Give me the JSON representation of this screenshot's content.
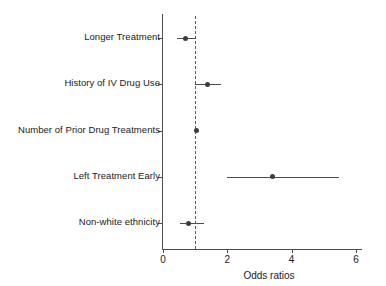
{
  "chart_data": {
    "type": "scatter",
    "subtype": "forest-plot",
    "title": "",
    "xlabel": "Odds ratios",
    "ylabel": "",
    "xlim": [
      0,
      6.3
    ],
    "xticks": [
      0,
      2,
      4,
      6
    ],
    "xtick_labels": [
      "0",
      "2",
      "4",
      "6"
    ],
    "grid": false,
    "legend": "none",
    "reference_line": {
      "value": 1,
      "style": "dashed",
      "color": "#5b5b6b"
    },
    "point_color": "#3c3c46",
    "line_color": "#4d4d4d",
    "categories": [
      "Longer Treatment",
      "History of IV Drug Use",
      "Number of Prior Drug Treatments",
      "Left Treatment Early",
      "Non-white ethnicity"
    ],
    "values": [
      0.71,
      1.37,
      1.05,
      3.39,
      0.78
    ],
    "ci_low": [
      0.44,
      1.0,
      1.0,
      1.99,
      0.53
    ],
    "ci_high": [
      1.03,
      1.8,
      1.1,
      5.47,
      1.27
    ],
    "points": [
      {
        "label": "Longer Treatment",
        "or": 0.71,
        "ci_low": 0.44,
        "ci_high": 1.03
      },
      {
        "label": "History of IV Drug Use",
        "or": 1.37,
        "ci_low": 1.0,
        "ci_high": 1.8
      },
      {
        "label": "Number of Prior Drug Treatments",
        "or": 1.05,
        "ci_low": 1.0,
        "ci_high": 1.1
      },
      {
        "label": "Left Treatment Early",
        "or": 3.39,
        "ci_low": 1.99,
        "ci_high": 5.47
      },
      {
        "label": "Non-white ethnicity",
        "or": 0.78,
        "ci_low": 0.53,
        "ci_high": 1.27
      }
    ]
  },
  "axis": {
    "x_title": "Odds ratios",
    "tick_0": "0",
    "tick_2": "2",
    "tick_4": "4",
    "tick_6": "6"
  }
}
